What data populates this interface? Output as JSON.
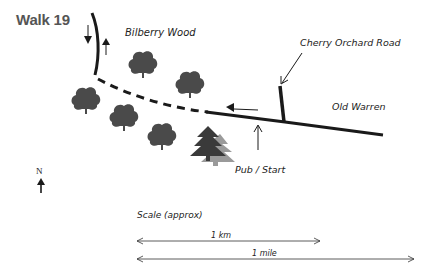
{
  "title": "Walk 19",
  "labels": {
    "wood": "Bilberry Wood",
    "road": "Cherry Orchard Road",
    "warren": "Old Warren",
    "start": "Pub / Start",
    "north": "N"
  },
  "scale": {
    "heading": "Scale (approx)",
    "km_label": "1 km",
    "mile_label": "1 mile"
  },
  "colors": {
    "tree": "#4a4a4a",
    "pine": "#3a3a3a",
    "pine_shadow": "#9a9a9a",
    "road": "#1a1a1a",
    "title": "#555555"
  }
}
